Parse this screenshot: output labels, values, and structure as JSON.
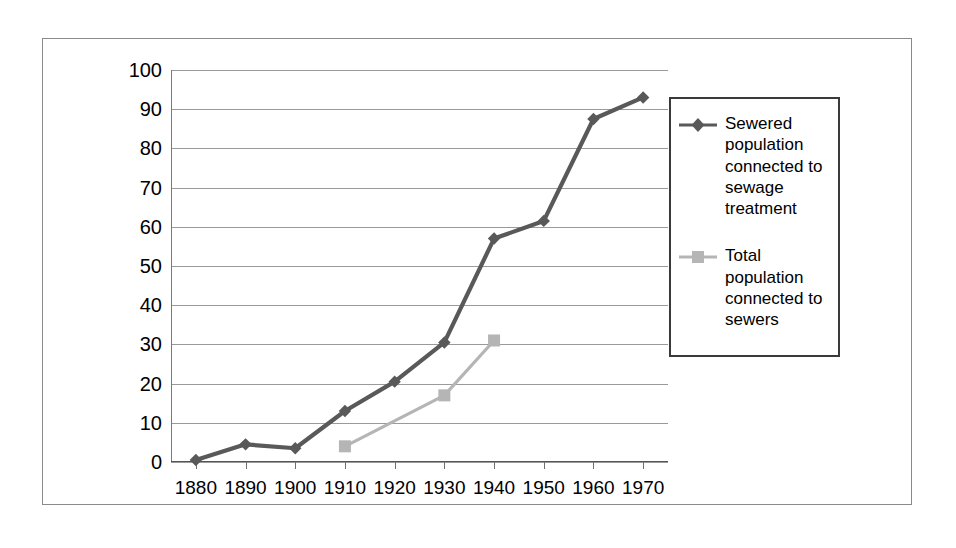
{
  "chart_data": {
    "type": "line",
    "title": "",
    "xlabel": "",
    "ylabel": "",
    "x": [
      1880,
      1890,
      1900,
      1910,
      1920,
      1930,
      1940,
      1950,
      1960,
      1970
    ],
    "categories": [
      "1880",
      "1890",
      "1900",
      "1910",
      "1920",
      "1930",
      "1940",
      "1950",
      "1960",
      "1970"
    ],
    "xlim": [
      1875,
      1975
    ],
    "ylim": [
      0,
      100
    ],
    "ytick_labels": [
      "0",
      "10",
      "20",
      "30",
      "40",
      "50",
      "60",
      "70",
      "80",
      "90",
      "100"
    ],
    "yticks": [
      0,
      10,
      20,
      30,
      40,
      50,
      60,
      70,
      80,
      90,
      100
    ],
    "grid": true,
    "grid_axis": "y",
    "legend_position": "right",
    "series": [
      {
        "name": "Sewered population connected to sewage treatment",
        "color": "#595959",
        "marker": "diamond",
        "x": [
          1880,
          1890,
          1900,
          1910,
          1920,
          1930,
          1940,
          1950,
          1960,
          1970
        ],
        "values": [
          0.5,
          4.5,
          3.5,
          13,
          20.5,
          30.5,
          57,
          61.5,
          87.5,
          93
        ]
      },
      {
        "name": "Total population connected to sewers",
        "color": "#b5b5b5",
        "marker": "square",
        "x": [
          1910,
          1930,
          1940
        ],
        "values": [
          4,
          17,
          31
        ]
      }
    ]
  },
  "legend": {
    "entries": [
      {
        "label": "Sewered population connected to sewage treatment",
        "color": "#595959",
        "marker": "diamond"
      },
      {
        "label": "Total population connected to sewers",
        "color": "#b5b5b5",
        "marker": "square"
      }
    ]
  },
  "colors": {
    "series_dark": "#595959",
    "series_light": "#b5b5b5",
    "gridline": "#9a9a9a",
    "border": "#8a8a8a",
    "legend_border": "#3a3a3a",
    "text": "#000000",
    "background": "#ffffff"
  }
}
